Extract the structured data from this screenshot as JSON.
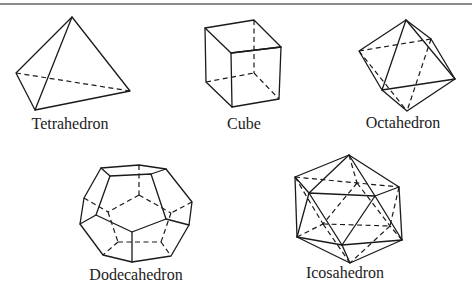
{
  "figure": {
    "solids": [
      {
        "name": "Tetrahedron",
        "label": "Tetrahedron"
      },
      {
        "name": "Cube",
        "label": "Cube"
      },
      {
        "name": "Octahedron",
        "label": "Octahedron"
      },
      {
        "name": "Dodecahedron",
        "label": "Dodecahedron"
      },
      {
        "name": "Icosahedron",
        "label": "Icosahedron"
      }
    ]
  },
  "colors": {
    "line": "#1a1a1a",
    "top_rule": "#8a8a8a",
    "background": "#ffffff"
  }
}
